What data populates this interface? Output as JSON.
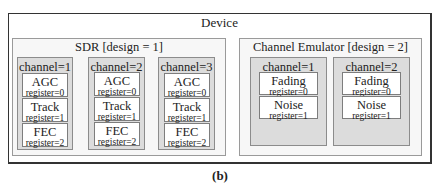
{
  "device": {
    "title": "Device",
    "designs": [
      {
        "title": "SDR [design = 1]",
        "channels": [
          {
            "title": "channel=1",
            "blocks": [
              {
                "name": "AGC",
                "register": "register=0"
              },
              {
                "name": "Track",
                "register": "register=1"
              },
              {
                "name": "FEC",
                "register": "register=2"
              }
            ]
          },
          {
            "title": "channel=2",
            "blocks": [
              {
                "name": "AGC",
                "register": "register=0"
              },
              {
                "name": "Track",
                "register": "register=1"
              },
              {
                "name": "FEC",
                "register": "register=2"
              }
            ]
          },
          {
            "title": "channel=3",
            "blocks": [
              {
                "name": "AGC",
                "register": "register=0"
              },
              {
                "name": "Track",
                "register": "register=1"
              },
              {
                "name": "FEC",
                "register": "register=2"
              }
            ]
          }
        ]
      },
      {
        "title": "Channel Emulator [design = 2]",
        "channels": [
          {
            "title": "channel=1",
            "blocks": [
              {
                "name": "Fading",
                "register": "register=0"
              },
              {
                "name": "Noise",
                "register": "register=1"
              }
            ]
          },
          {
            "title": "channel=2",
            "blocks": [
              {
                "name": "Fading",
                "register": "register=0"
              },
              {
                "name": "Noise",
                "register": "register=1"
              }
            ]
          }
        ]
      }
    ]
  },
  "caption": "(b)"
}
